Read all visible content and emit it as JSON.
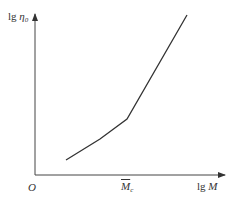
{
  "chart_data": {
    "type": "line",
    "title": "",
    "xlabel": "lg M",
    "ylabel": "lg η0",
    "origin_label": "O",
    "x_tick_labels": [
      "M̄c"
    ],
    "grid": false,
    "legend": null,
    "annotations": [
      "Critical molecular weight M̄c marks change of slope"
    ],
    "series": [
      {
        "name": "lg η0 vs lg M",
        "points_px": [
          [
            66,
            160
          ],
          [
            100,
            139
          ],
          [
            127,
            119
          ],
          [
            187,
            15
          ]
        ],
        "x": [
          0.22,
          0.4,
          0.55,
          0.88
        ],
        "y": [
          0.1,
          0.23,
          0.35,
          1.0
        ]
      }
    ],
    "xlim": [
      0,
      1
    ],
    "ylim": [
      0,
      1
    ]
  },
  "labels": {
    "y_axis_main": "lg ",
    "y_axis_sym": "η",
    "y_axis_sub": "0",
    "x_axis_main": "lg ",
    "x_axis_sym": "M",
    "origin": "O",
    "mc_sym": "M",
    "mc_sub": "c"
  }
}
